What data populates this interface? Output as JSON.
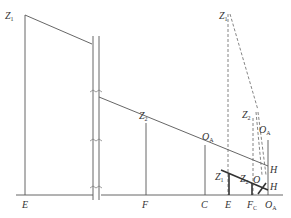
{
  "diagram": {
    "type": "geometric-construction",
    "colors": {
      "line": "#555555",
      "bold": "#333333",
      "label": "#333333",
      "background": "#ffffff"
    },
    "left_section": {
      "labels": {
        "z1": {
          "main": "Z",
          "sub": "1"
        },
        "z2": {
          "main": "Z",
          "sub": "2"
        },
        "o_a": {
          "main": "O",
          "sub": "A"
        },
        "h": {
          "main": "H",
          "sub": ""
        },
        "e": {
          "main": "E",
          "sub": ""
        },
        "f": {
          "main": "F",
          "sub": ""
        },
        "c": {
          "main": "C",
          "sub": ""
        }
      }
    },
    "right_section": {
      "labels": {
        "z1_top": {
          "main": "Z",
          "sub": "1"
        },
        "z2_mid": {
          "main": "Z",
          "sub": "2"
        },
        "o_a_mid": {
          "main": "O",
          "sub": "A"
        },
        "h_upper": {
          "main": "H",
          "sub": ""
        },
        "z1_low": {
          "main": "Z",
          "sub": "1"
        },
        "z2_low": {
          "main": "Z",
          "sub": "2"
        },
        "o_low": {
          "main": "O",
          "sub": ""
        },
        "h_lower": {
          "main": "H",
          "sub": ""
        },
        "e_base": {
          "main": "E",
          "sub": ""
        },
        "f_base": {
          "main": "F",
          "sub": "C"
        },
        "o_base": {
          "main": "O",
          "sub": "A"
        }
      }
    }
  }
}
